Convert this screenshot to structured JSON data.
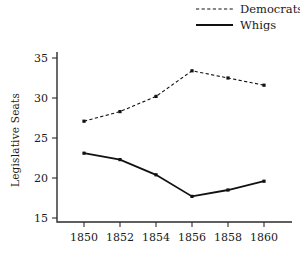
{
  "chart_data": {
    "type": "line",
    "title": "",
    "subtitle": "",
    "xlabel": "",
    "ylabel": "Legislative Seats",
    "x": [
      1850,
      1852,
      1854,
      1856,
      1858,
      1860
    ],
    "categories": [
      "1850",
      "1852",
      "1854",
      "1856",
      "1858",
      "1860"
    ],
    "xtick_labels": [
      "1850",
      "1852",
      "1854",
      "1856",
      "1858",
      "1860"
    ],
    "ytick_labels": [
      "15",
      "20",
      "25",
      "30",
      "35"
    ],
    "yticks": [
      15,
      20,
      25,
      30,
      35
    ],
    "xlim": [
      1849,
      1861
    ],
    "ylim": [
      14.5,
      35.6
    ],
    "grid": false,
    "legend_position": "top-right",
    "series": [
      {
        "name": "Democrats",
        "style": "dashed",
        "marker": "dot",
        "color": "#111111",
        "values": [
          27.1,
          28.3,
          30.2,
          33.4,
          32.5,
          31.6
        ]
      },
      {
        "name": "Whigs",
        "style": "solid",
        "marker": "dot",
        "color": "#111111",
        "values": [
          23.1,
          22.3,
          20.4,
          17.7,
          18.5,
          19.6
        ]
      }
    ]
  },
  "legend": {
    "entries": [
      {
        "label": "Democrats",
        "style": "dashed"
      },
      {
        "label": "Whigs",
        "style": "solid"
      }
    ]
  },
  "axes": {
    "y_title": "Legislative Seats"
  },
  "colors": {
    "background": "#ffffff",
    "ink": "#111111",
    "axis": "#2b2b2b"
  }
}
